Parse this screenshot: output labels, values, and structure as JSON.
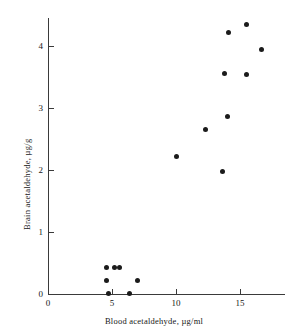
{
  "chart_data": {
    "type": "scatter",
    "title": "",
    "xlabel": "Blood acetaldehyde, µg/ml",
    "ylabel": "Brain acetaldehyde, µg/g",
    "xlim": [
      0,
      18.5
    ],
    "ylim": [
      0,
      4.6
    ],
    "xticks": [
      0,
      5,
      10,
      15
    ],
    "xtick_labels": [
      "0",
      "5",
      "10",
      "15"
    ],
    "yticks": [
      0,
      1,
      2,
      3,
      4
    ],
    "ytick_labels": [
      "0",
      "1",
      "2",
      "3",
      "4"
    ],
    "grid": false,
    "legend": null,
    "marker_color": "#1b1b1b",
    "axis_color": "#3a3a3a",
    "points": [
      {
        "x": 4.6,
        "y": 0.42
      },
      {
        "x": 5.2,
        "y": 0.42
      },
      {
        "x": 5.55,
        "y": 0.42
      },
      {
        "x": 4.6,
        "y": 0.22
      },
      {
        "x": 7.0,
        "y": 0.22
      },
      {
        "x": 4.7,
        "y": 0.01
      },
      {
        "x": 6.4,
        "y": 0.01
      },
      {
        "x": 10.0,
        "y": 2.21
      },
      {
        "x": 12.3,
        "y": 2.65
      },
      {
        "x": 13.6,
        "y": 1.98
      },
      {
        "x": 14.0,
        "y": 2.86
      },
      {
        "x": 13.8,
        "y": 3.55
      },
      {
        "x": 15.5,
        "y": 3.54
      },
      {
        "x": 14.1,
        "y": 4.22
      },
      {
        "x": 15.5,
        "y": 4.34
      },
      {
        "x": 16.7,
        "y": 3.95
      }
    ]
  }
}
